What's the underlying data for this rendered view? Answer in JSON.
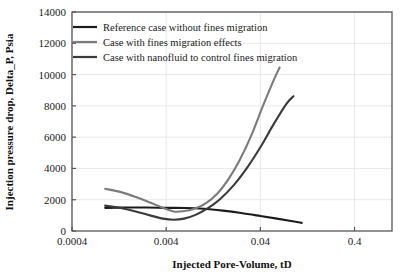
{
  "chart_data": {
    "type": "line",
    "title": "",
    "xlabel": "Injected Pore-Volume, tD",
    "ylabel": "Injection pressure drop, Delta_P, Psia",
    "xscale": "log",
    "yscale": "linear",
    "xlim": [
      0.0004,
      1.0
    ],
    "ylim": [
      0,
      14000
    ],
    "grid": "horizontal",
    "legend_position": "top-left-inside",
    "xticks": [
      0.0004,
      0.004,
      0.04,
      0.4
    ],
    "xtick_labels": [
      "0.0004",
      "0.004",
      "0.04",
      "0.4"
    ],
    "yticks": [
      0,
      2000,
      4000,
      6000,
      8000,
      10000,
      12000,
      14000
    ],
    "ytick_labels": [
      "0",
      "2000",
      "4000",
      "6000",
      "8000",
      "10000",
      "12000",
      "14000"
    ],
    "series": [
      {
        "name": "Reference case without fines migration",
        "color": "#1c1c1c",
        "width": 2.1,
        "points": [
          [
            0.0009,
            1480
          ],
          [
            0.0015,
            1500
          ],
          [
            0.0025,
            1500
          ],
          [
            0.004,
            1480
          ],
          [
            0.0065,
            1470
          ],
          [
            0.01,
            1420
          ],
          [
            0.016,
            1300
          ],
          [
            0.025,
            1150
          ],
          [
            0.04,
            960
          ],
          [
            0.06,
            790
          ],
          [
            0.085,
            640
          ],
          [
            0.11,
            520
          ]
        ]
      },
      {
        "name": "Case with fines migration effects",
        "color": "#7b7b7b",
        "width": 2.1,
        "points": [
          [
            0.0009,
            2700
          ],
          [
            0.0013,
            2500
          ],
          [
            0.0019,
            2180
          ],
          [
            0.0027,
            1820
          ],
          [
            0.0037,
            1480
          ],
          [
            0.0048,
            1250
          ],
          [
            0.006,
            1260
          ],
          [
            0.008,
            1420
          ],
          [
            0.0105,
            1760
          ],
          [
            0.014,
            2400
          ],
          [
            0.0185,
            3350
          ],
          [
            0.024,
            4500
          ],
          [
            0.032,
            6100
          ],
          [
            0.042,
            7900
          ],
          [
            0.055,
            9600
          ],
          [
            0.064,
            10450
          ]
        ]
      },
      {
        "name": "Case with nanofluid to control fines migration",
        "color": "#3a3a3a",
        "width": 2.1,
        "points": [
          [
            0.0009,
            1620
          ],
          [
            0.0013,
            1480
          ],
          [
            0.0019,
            1250
          ],
          [
            0.0027,
            1000
          ],
          [
            0.0037,
            790
          ],
          [
            0.0048,
            720
          ],
          [
            0.0062,
            790
          ],
          [
            0.0082,
            1030
          ],
          [
            0.011,
            1440
          ],
          [
            0.015,
            2050
          ],
          [
            0.021,
            2950
          ],
          [
            0.029,
            4050
          ],
          [
            0.04,
            5350
          ],
          [
            0.055,
            6800
          ],
          [
            0.075,
            8100
          ],
          [
            0.09,
            8620
          ]
        ]
      }
    ]
  },
  "legend": {
    "entries": [
      {
        "label": "Reference case without fines migration"
      },
      {
        "label": "Case with fines migration effects"
      },
      {
        "label": "Case with nanofluid to control fines migration"
      }
    ]
  },
  "colors": {
    "axis": "#555555",
    "grid": "#e9e9e9",
    "text": "#1a1a1a",
    "background": "#ffffff"
  }
}
